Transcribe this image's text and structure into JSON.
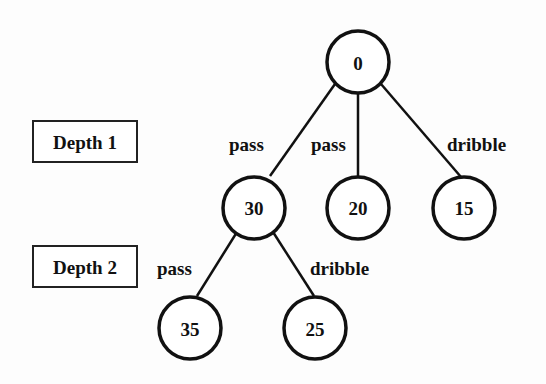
{
  "diagram": {
    "type": "tree",
    "depth_labels": [
      {
        "id": "depth1",
        "label": "Depth 1"
      },
      {
        "id": "depth2",
        "label": "Depth 2"
      }
    ],
    "nodes": [
      {
        "id": "root",
        "value": "0",
        "depth": 0
      },
      {
        "id": "n30",
        "value": "30",
        "depth": 1
      },
      {
        "id": "n20",
        "value": "20",
        "depth": 1
      },
      {
        "id": "n15",
        "value": "15",
        "depth": 1
      },
      {
        "id": "n35",
        "value": "35",
        "depth": 2
      },
      {
        "id": "n25",
        "value": "25",
        "depth": 2
      }
    ],
    "edges": [
      {
        "from": "root",
        "to": "n30",
        "label": "pass"
      },
      {
        "from": "root",
        "to": "n20",
        "label": "pass"
      },
      {
        "from": "root",
        "to": "n15",
        "label": "dribble"
      },
      {
        "from": "n30",
        "to": "n35",
        "label": "pass"
      },
      {
        "from": "n30",
        "to": "n25",
        "label": "dribble"
      }
    ]
  }
}
